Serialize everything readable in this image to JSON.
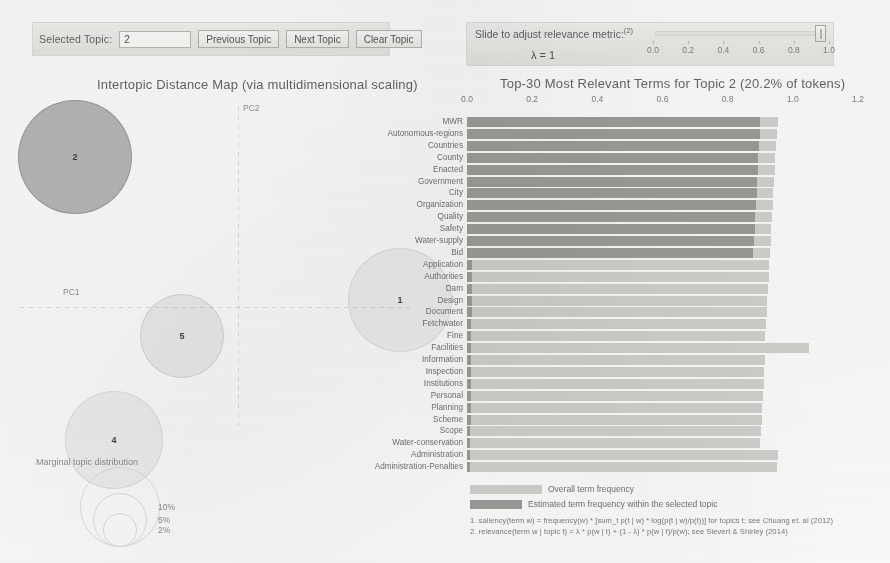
{
  "controls": {
    "selected_topic_label": "Selected Topic:",
    "selected_topic_value": "2",
    "previous_topic": "Previous Topic",
    "next_topic": "Next Topic",
    "clear_topic": "Clear Topic",
    "lambda_title": "Slide to adjust relevance metric:",
    "lambda_superscript": "(2)",
    "lambda_value_label": "λ = 1",
    "lambda_ticks": [
      "0.0",
      "0.2",
      "0.4",
      "0.6",
      "0.8",
      "1.0"
    ],
    "lambda_current": 1.0
  },
  "map": {
    "title": "Intertopic Distance Map (via multidimensional scaling)",
    "axis_x_label": "PC1",
    "axis_y_label": "PC2",
    "topics": [
      {
        "id": "2",
        "cx": 75,
        "cy": 62,
        "r": 57,
        "selected": true
      },
      {
        "id": "1",
        "cx": 400,
        "cy": 205,
        "r": 52,
        "selected": false
      },
      {
        "id": "5",
        "cx": 182,
        "cy": 241,
        "r": 42,
        "selected": false
      },
      {
        "id": "4",
        "cx": 114,
        "cy": 345,
        "r": 49,
        "selected": false
      }
    ],
    "legend_title": "Marginal topic distribution",
    "legend_sizes": [
      "2%",
      "5%",
      "10%"
    ]
  },
  "chart_data": {
    "type": "bar",
    "title": "Top-30 Most Relevant Terms for Topic 2 (20.2% of tokens)",
    "topic_number": 2,
    "topic_token_share": "20.2%",
    "xlabel": "",
    "ylabel": "",
    "xlim": [
      0.0,
      1.2
    ],
    "xticks": [
      "0.0",
      "0.2",
      "0.4",
      "0.6",
      "0.8",
      "1.0",
      "1.2"
    ],
    "grid": false,
    "legend_position": "bottom",
    "series": [
      {
        "name": "Overall term frequency",
        "color": "#d2d0cc"
      },
      {
        "name": "Estimated term frequency within the selected topic",
        "color": "#9b9995"
      }
    ],
    "categories": [
      "MWR",
      "Autonomous-regions",
      "Countries",
      "County",
      "Enacted",
      "Government",
      "City",
      "Organization",
      "Quality",
      "Safety",
      "Water-supply",
      "Bid",
      "Application",
      "Authorities",
      "Dam",
      "Design",
      "Document",
      "Fetchwater",
      "Fine",
      "Facilities",
      "Information",
      "Inspection",
      "Institutions",
      "Personal",
      "Planning",
      "Scheme",
      "Scope",
      "Water-conservation",
      "Administration",
      "Administration-Penalties"
    ],
    "overall": [
      0.955,
      0.95,
      0.948,
      0.945,
      0.944,
      0.942,
      0.94,
      0.938,
      0.936,
      0.934,
      0.932,
      0.93,
      0.928,
      0.926,
      0.924,
      0.922,
      0.92,
      0.918,
      0.916,
      1.05,
      0.914,
      0.912,
      0.91,
      0.908,
      0.906,
      0.904,
      0.902,
      0.9,
      0.955,
      0.95
    ],
    "topic": [
      0.9,
      0.898,
      0.896,
      0.894,
      0.893,
      0.891,
      0.889,
      0.887,
      0.885,
      0.883,
      0.881,
      0.879,
      0.015,
      0.015,
      0.014,
      0.014,
      0.014,
      0.013,
      0.013,
      0.013,
      0.012,
      0.012,
      0.012,
      0.011,
      0.011,
      0.011,
      0.01,
      0.01,
      0.01,
      0.01
    ]
  },
  "footnotes": [
    "1. saliency(term w) = frequency(w) * [sum_t p(t | w) * log(p(t | w)/p(t))] for topics t; see Chuang et. al (2012)",
    "2. relevance(term w | topic t) = λ * p(w | t) + (1 - λ) * p(w | t)/p(w); see Sievert & Shirley (2014)"
  ]
}
